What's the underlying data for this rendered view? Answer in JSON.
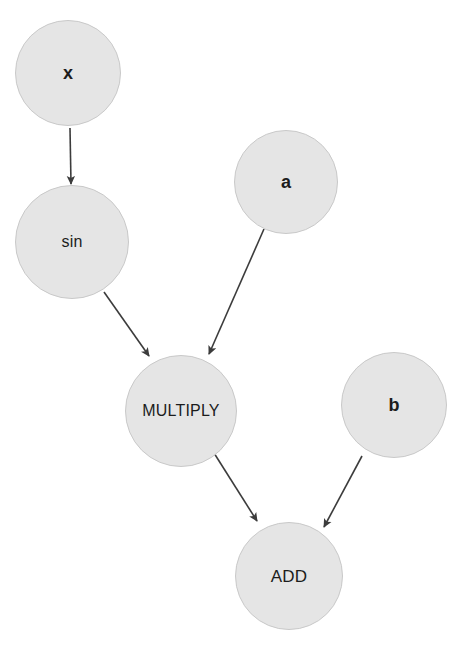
{
  "diagram": {
    "type": "directed-graph",
    "background_color": "#ffffff",
    "node_fill_color": "#e5e5e5",
    "node_border_color": "#c9c9c9",
    "node_text_color": "#1c1c1c",
    "edge_color": "#3c3c3c",
    "expression": "sin(x) * a + b",
    "nodes": [
      {
        "id": "x",
        "label": "x",
        "kind": "input-variable",
        "cx": 68,
        "cy": 73,
        "r": 53,
        "font_size": 18,
        "bold": true
      },
      {
        "id": "sin",
        "label": "sin",
        "kind": "operation",
        "cx": 72,
        "cy": 242,
        "r": 57,
        "font_size": 16,
        "bold": false
      },
      {
        "id": "a",
        "label": "a",
        "kind": "input-variable",
        "cx": 286,
        "cy": 182,
        "r": 52,
        "font_size": 18,
        "bold": true
      },
      {
        "id": "multiply",
        "label": "MULTIPLY",
        "kind": "operation",
        "cx": 181,
        "cy": 411,
        "r": 56,
        "font_size": 16,
        "bold": false
      },
      {
        "id": "b",
        "label": "b",
        "kind": "input-variable",
        "cx": 394,
        "cy": 405,
        "r": 53,
        "font_size": 18,
        "bold": true
      },
      {
        "id": "add",
        "label": "ADD",
        "kind": "operation",
        "cx": 289,
        "cy": 576,
        "r": 54,
        "font_size": 17,
        "bold": false
      }
    ],
    "edges": [
      {
        "id": "x-to-sin",
        "from": "x",
        "to": "sin",
        "x1": 70,
        "y1": 128,
        "x2": 71,
        "y2": 184
      },
      {
        "id": "sin-to-multiply",
        "from": "sin",
        "to": "multiply",
        "x1": 104,
        "y1": 292,
        "x2": 149,
        "y2": 356
      },
      {
        "id": "a-to-multiply",
        "from": "a",
        "to": "multiply",
        "x1": 264,
        "y1": 229,
        "x2": 209,
        "y2": 354
      },
      {
        "id": "multiply-to-add",
        "from": "multiply",
        "to": "add",
        "x1": 214,
        "y1": 453,
        "x2": 257,
        "y2": 521
      },
      {
        "id": "b-to-add",
        "from": "b",
        "to": "add",
        "x1": 362,
        "y1": 456,
        "x2": 324,
        "y2": 527
      }
    ]
  }
}
